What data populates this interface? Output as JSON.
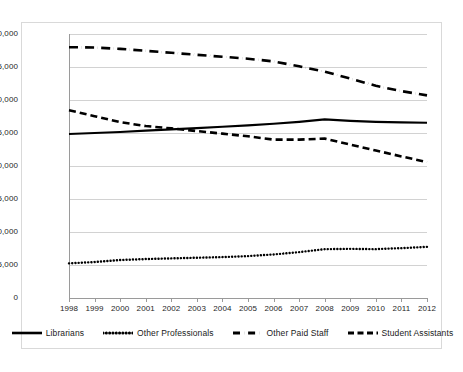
{
  "chart_data": {
    "type": "line",
    "title": "",
    "xlabel": "",
    "ylabel": "",
    "x": [
      1998,
      1999,
      2000,
      2001,
      2002,
      2003,
      2004,
      2005,
      2006,
      2007,
      2008,
      2009,
      2010,
      2011,
      2012
    ],
    "categories": [
      "1998",
      "1999",
      "2000",
      "2001",
      "2002",
      "2003",
      "2004",
      "2005",
      "2006",
      "2007",
      "2008",
      "2009",
      "2010",
      "2011",
      "2012"
    ],
    "ylim": [
      0,
      40000
    ],
    "xlim": [
      1998,
      2012
    ],
    "ytick_labels": [
      "40,000",
      "35,000",
      "30,000",
      "25,000",
      "20,000",
      "15,000",
      "10,000",
      "5,000",
      "0"
    ],
    "ytick_values": [
      40000,
      35000,
      30000,
      25000,
      20000,
      15000,
      10000,
      5000,
      0
    ],
    "grid": true,
    "legend_position": "bottom",
    "series": [
      {
        "name": "Librarians",
        "style": "solid",
        "color": "#000000",
        "values": [
          24850,
          25000,
          25150,
          25350,
          25550,
          25750,
          25950,
          26150,
          26400,
          26700,
          27050,
          26850,
          26700,
          26600,
          26550
        ]
      },
      {
        "name": "Other Professionals",
        "style": "dotted",
        "color": "#000000",
        "values": [
          5250,
          5450,
          5750,
          5900,
          6000,
          6100,
          6200,
          6350,
          6600,
          6950,
          7400,
          7450,
          7400,
          7550,
          7750
        ]
      },
      {
        "name": "Other Paid Staff",
        "style": "dash-dot",
        "color": "#000000",
        "values": [
          38000,
          37950,
          37750,
          37450,
          37150,
          36850,
          36550,
          36250,
          35850,
          35100,
          34300,
          33250,
          32150,
          31350,
          30700
        ]
      },
      {
        "name": "Student Assistants",
        "style": "dashed",
        "color": "#000000",
        "values": [
          28450,
          27550,
          26650,
          26050,
          25700,
          25300,
          24900,
          24500,
          24000,
          24000,
          24150,
          23250,
          22350,
          21450,
          20600
        ]
      }
    ]
  },
  "legend": {
    "items": [
      {
        "label": "Librarians",
        "icon": "solid-line-swatch"
      },
      {
        "label": "Other Professionals",
        "icon": "dotted-line-swatch"
      },
      {
        "label": "Other Paid Staff",
        "icon": "dash-dot-line-swatch"
      },
      {
        "label": "Student Assistants",
        "icon": "dashed-line-swatch"
      }
    ]
  }
}
